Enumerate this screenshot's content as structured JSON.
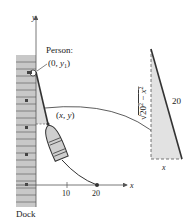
{
  "figure": {
    "dock_label": "Dock",
    "person_label": "Person:",
    "person_coord": "(0, y₁)",
    "boat_coord": "(x, y)",
    "axis_x_label": "x",
    "axis_y_label": "y",
    "x_ticks": [
      "10",
      "20"
    ],
    "triangle": {
      "hypotenuse_label": "20",
      "base_label": "x",
      "height_label": "√(20² − x²)",
      "height_radicand": "20² − x²"
    }
  },
  "colors": {
    "dock_fill": "#c8c8c8",
    "dock_stripe": "#707070",
    "shade": "#dcdcdc",
    "line": "#333333"
  }
}
